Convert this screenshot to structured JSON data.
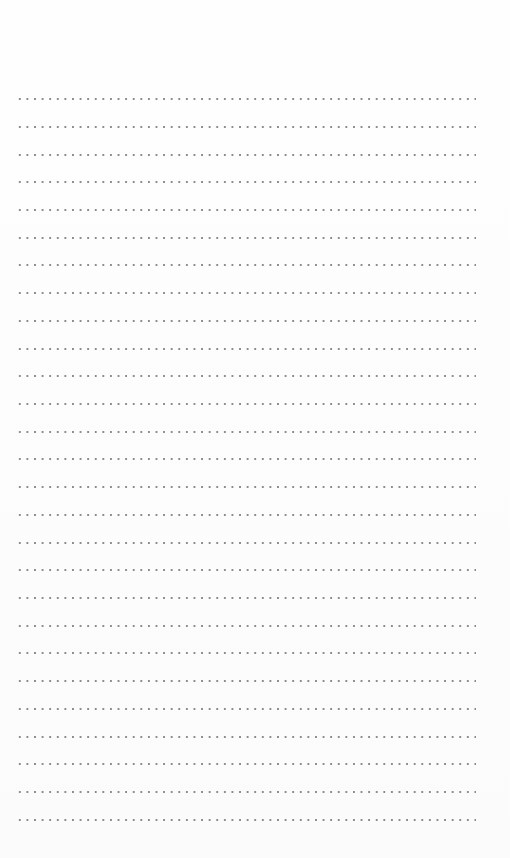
{
  "page": {
    "type": "blank-dotted-writing-sheet",
    "background_color": "#fdfdfd",
    "dot_color": "#8c8c8c",
    "line_count": 27,
    "line_positions_y": [
      99,
      127,
      155,
      182,
      210,
      238,
      265,
      293,
      321,
      349,
      376,
      404,
      432,
      459,
      487,
      515,
      543,
      570,
      598,
      626,
      653,
      681,
      709,
      737,
      764,
      792,
      820
    ],
    "line_start_x": 16,
    "line_end_x": 476
  }
}
